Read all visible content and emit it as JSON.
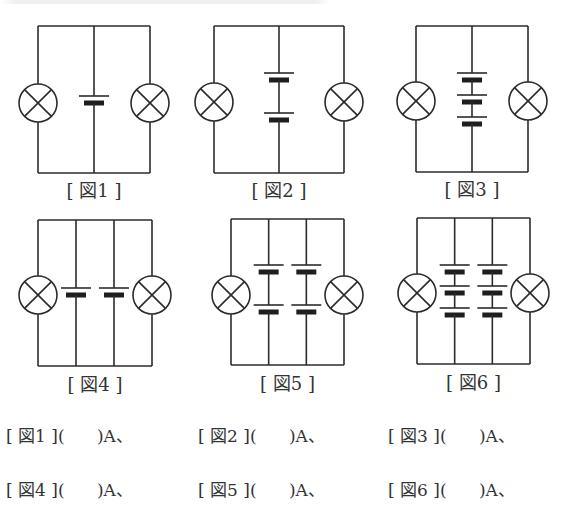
{
  "style": {
    "stroke": "#2b2b2b",
    "plate_fill": "#1e1e1e",
    "background": "#ffffff"
  },
  "circuits": [
    {
      "id": "fig1",
      "label": "[ 図1 ]",
      "frame": {
        "left": 37,
        "right": 150,
        "top": 26,
        "bottom": 173
      },
      "verticals": [
        93
      ],
      "lamps": [
        {
          "cx": 38,
          "cy": 103,
          "r": 19
        },
        {
          "cx": 150,
          "cy": 103,
          "r": 19
        }
      ],
      "batteries": [
        {
          "x": 93,
          "long_y": 96,
          "short_y": 103
        }
      ],
      "label_pos": {
        "x": 93,
        "y": 176
      }
    },
    {
      "id": "fig2",
      "label": "[ 図2 ]",
      "frame": {
        "left": 214,
        "right": 320,
        "top": 26,
        "bottom": 173
      },
      "verticals": [
        267
      ],
      "lamps": [
        {
          "cx": 214,
          "cy": 102,
          "r": 19
        },
        {
          "cx": 344,
          "cy": 102,
          "r": 19
        }
      ],
      "batteries": [
        {
          "x": 287,
          "long_y": 73,
          "short_y": 80
        },
        {
          "x": 287,
          "long_y": 113,
          "short_y": 120
        }
      ],
      "label_pos": {
        "x": 268,
        "y": 176
      }
    },
    {
      "id": "fig3",
      "label": "[ 図3 ]",
      "frame": {
        "left": 416,
        "right": 528,
        "top": 26,
        "bottom": 172
      },
      "verticals": [
        471
      ],
      "lamps": [
        {
          "cx": 416,
          "cy": 101,
          "r": 19
        },
        {
          "cx": 528,
          "cy": 101,
          "r": 19
        }
      ],
      "batteries": [
        {
          "x": 471,
          "long_y": 73,
          "short_y": 80
        },
        {
          "x": 471,
          "long_y": 95,
          "short_y": 102
        },
        {
          "x": 471,
          "long_y": 117,
          "short_y": 124
        }
      ],
      "label_pos": {
        "x": 470,
        "y": 175
      }
    },
    {
      "id": "fig4",
      "label": "[ 図4 ]",
      "frame": {
        "left": 37,
        "right": 152,
        "top": 220,
        "bottom": 366
      },
      "verticals": [
        80,
        114
      ],
      "lamps": [
        {
          "cx": 38,
          "cy": 295,
          "r": 19
        },
        {
          "cx": 152,
          "cy": 295,
          "r": 19
        }
      ],
      "batteries": [
        {
          "x": 80,
          "long_y": 288,
          "short_y": 295
        },
        {
          "x": 114,
          "long_y": 288,
          "short_y": 295
        }
      ],
      "label_pos": {
        "x": 95,
        "y": 370
      }
    },
    {
      "id": "fig5",
      "label": "[ 図5 ]",
      "frame": {
        "left": 231,
        "right": 344,
        "top": 219,
        "bottom": 365
      },
      "verticals": [
        272,
        306
      ],
      "lamps": [
        {
          "cx": 231,
          "cy": 295,
          "r": 19
        },
        {
          "cx": 344,
          "cy": 295,
          "r": 19
        }
      ],
      "batteries": [
        {
          "x": 272,
          "long_y": 265,
          "short_y": 272
        },
        {
          "x": 272,
          "long_y": 305,
          "short_y": 312
        },
        {
          "x": 306,
          "long_y": 265,
          "short_y": 272
        },
        {
          "x": 306,
          "long_y": 305,
          "short_y": 312
        }
      ],
      "label_pos": {
        "x": 289,
        "y": 369
      }
    },
    {
      "id": "fig6",
      "label": "[ 図6 ]",
      "frame": {
        "left": 417,
        "right": 530,
        "top": 218,
        "bottom": 364
      },
      "verticals": [
        457,
        491
      ],
      "lamps": [
        {
          "cx": 417,
          "cy": 293,
          "r": 19
        },
        {
          "cx": 530,
          "cy": 293,
          "r": 19
        }
      ],
      "batteries": [
        {
          "x": 457,
          "long_y": 265,
          "short_y": 272
        },
        {
          "x": 457,
          "long_y": 286,
          "short_y": 293
        },
        {
          "x": 457,
          "long_y": 308,
          "short_y": 315
        },
        {
          "x": 491,
          "long_y": 265,
          "short_y": 272
        },
        {
          "x": 491,
          "long_y": 286,
          "short_y": 293
        },
        {
          "x": 491,
          "long_y": 308,
          "short_y": 315
        }
      ],
      "label_pos": {
        "x": 475,
        "y": 368
      }
    }
  ],
  "answers": {
    "rows": [
      {
        "y": 436,
        "items": [
          {
            "x": 6,
            "text": "[ 図1 ](      )A、"
          },
          {
            "x": 198,
            "text": "[ 図2 ](      )A、"
          },
          {
            "x": 388,
            "text": "[ 図3 ](      )A、"
          }
        ]
      },
      {
        "y": 490,
        "items": [
          {
            "x": 6,
            "text": "[ 図4 ](      )A、"
          },
          {
            "x": 198,
            "text": "[ 図5 ](      )A、"
          },
          {
            "x": 388,
            "text": "[ 図6 ](      )A、"
          }
        ]
      }
    ]
  }
}
